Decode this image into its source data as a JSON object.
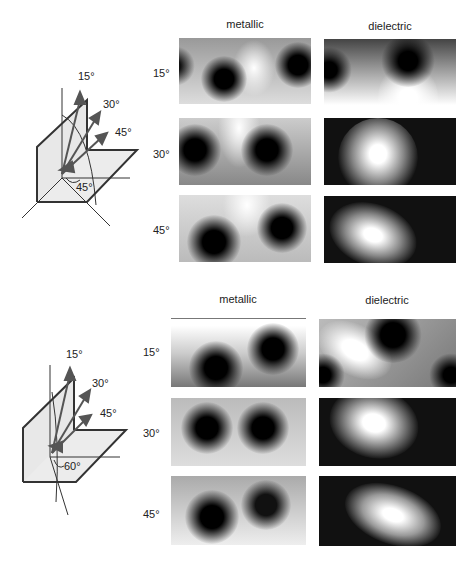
{
  "panels": [
    {
      "columns": [
        "metallic",
        "dielectric"
      ],
      "rows": [
        "15°",
        "30°",
        "45°"
      ],
      "diagram": {
        "arrow_labels": [
          "15°",
          "30°",
          "45°"
        ],
        "base_angle_label": "45°"
      }
    },
    {
      "columns": [
        "metallic",
        "dielectric"
      ],
      "rows": [
        "15°",
        "30°",
        "45°"
      ],
      "diagram": {
        "arrow_labels": [
          "15°",
          "30°",
          "45°"
        ],
        "base_angle_label": "60°"
      }
    }
  ]
}
